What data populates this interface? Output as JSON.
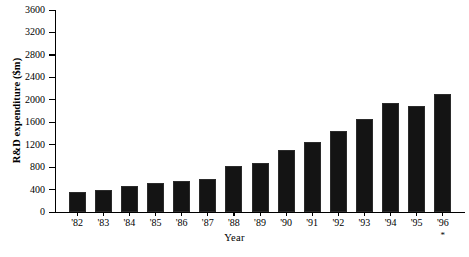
{
  "chart_data": {
    "type": "bar",
    "title": "",
    "subtitle": "",
    "xlabel": "Year",
    "ylabel": "R&D expenditure ($m)",
    "categories": [
      "'82",
      "'83",
      "'84",
      "'85",
      "'86",
      "'87",
      "'88",
      "'89",
      "'90",
      "'91",
      "'92",
      "'93",
      "'94",
      "'95",
      "'96"
    ],
    "values": [
      360,
      400,
      470,
      510,
      550,
      590,
      820,
      880,
      1110,
      1240,
      1450,
      1660,
      1940,
      1890,
      2110
    ],
    "ylim": [
      0,
      3600
    ],
    "ytick_step": 400,
    "ytick_labels": [
      "0",
      "400",
      "800",
      "1200",
      "1600",
      "2000",
      "2400",
      "2800",
      "3200",
      "3600"
    ],
    "ytick_values": [
      0,
      400,
      800,
      1200,
      1600,
      2000,
      2400,
      2800,
      3200,
      3600
    ],
    "grid": false,
    "legend": false,
    "legend_position": "none",
    "bar_color": "#141414",
    "annotations": [
      {
        "target_category": "'96",
        "text": "*"
      }
    ]
  },
  "axes": {
    "y_title": "R&D expenditure ($m)",
    "x_title": "Year"
  }
}
